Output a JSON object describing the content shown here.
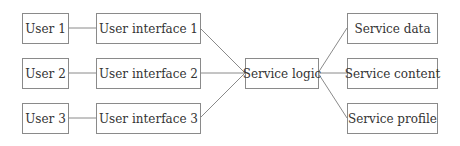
{
  "diagram": {
    "users": [
      {
        "label": "User 1"
      },
      {
        "label": "User 2"
      },
      {
        "label": "User 3"
      }
    ],
    "interfaces": [
      {
        "label": "User interface 1"
      },
      {
        "label": "User interface 2"
      },
      {
        "label": "User interface 3"
      }
    ],
    "logic": {
      "label": "Service logic"
    },
    "services": [
      {
        "label": "Service data"
      },
      {
        "label": "Service content"
      },
      {
        "label": "Service profile"
      }
    ],
    "edges": [
      [
        "User 1",
        "User interface 1"
      ],
      [
        "User 2",
        "User interface 2"
      ],
      [
        "User 3",
        "User interface 3"
      ],
      [
        "User interface 1",
        "Service logic"
      ],
      [
        "User interface 2",
        "Service logic"
      ],
      [
        "User interface 3",
        "Service logic"
      ],
      [
        "Service logic",
        "Service data"
      ],
      [
        "Service logic",
        "Service content"
      ],
      [
        "Service logic",
        "Service profile"
      ]
    ],
    "line_color": "#8a8a8a"
  }
}
